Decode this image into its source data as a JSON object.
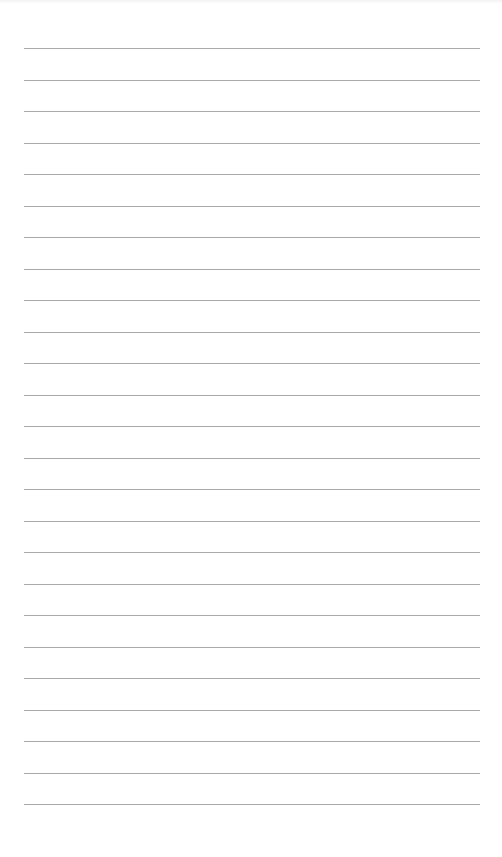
{
  "paper": {
    "type": "lined-paper",
    "background_color": "#ffffff",
    "line_color": "#a9a9a9",
    "line_count": 25,
    "first_line_y": 48,
    "line_spacing": 31.5,
    "margin_left": 24,
    "margin_right": 22
  }
}
